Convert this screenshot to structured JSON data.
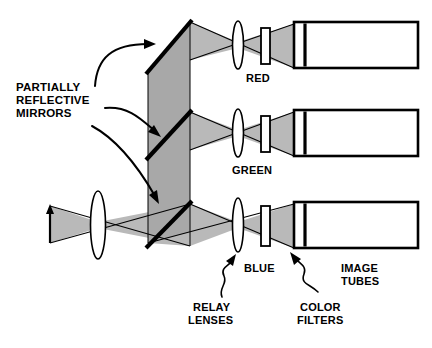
{
  "diagram": {
    "colors": {
      "beam_gray": "#b9b9b9",
      "beam_gray_dark": "#a8a8a8",
      "ink": "#000000",
      "background": "#ffffff"
    },
    "labels": {
      "partially_reflective_mirrors": {
        "line1": "PARTIALLY",
        "line2": "REFLECTIVE",
        "line3": "MIRRORS"
      },
      "red": "RED",
      "green": "GREEN",
      "blue": "BLUE",
      "relay_lenses": {
        "line1": "RELAY",
        "line2": "LENSES"
      },
      "color_filters": {
        "line1": "COLOR",
        "line2": "FILTERS"
      },
      "image_tubes": {
        "line1": "IMAGE",
        "line2": "TUBES"
      }
    },
    "channels": [
      {
        "name": "red",
        "label": "RED",
        "row_y": 45
      },
      {
        "name": "green",
        "label": "GREEN",
        "row_y": 133
      },
      {
        "name": "blue",
        "label": "BLUE",
        "row_y": 224
      }
    ],
    "components": {
      "objective_lens": "objective-lens",
      "relay_lens": "relay-lens",
      "color_filter": "color-filter",
      "image_tube": "image-tube",
      "partial_mirror": "partially-reflective-mirror",
      "object_arrow": "object-arrow"
    }
  }
}
